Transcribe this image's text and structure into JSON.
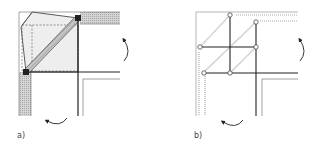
{
  "figure": {
    "panels": [
      {
        "id": "a",
        "label": "a)",
        "description": "Corner joint with diagonal brace and dashed square, hatched walls, rotation arrows"
      },
      {
        "id": "b",
        "label": "b)",
        "description": "Corner joint truss diagram with pin nodes and black members, rotation arrows"
      }
    ],
    "colors": {
      "line": "#333333",
      "hatch": "#b8b8b8",
      "fill_light": "#ececec",
      "node_fill": "#ffffff"
    }
  }
}
